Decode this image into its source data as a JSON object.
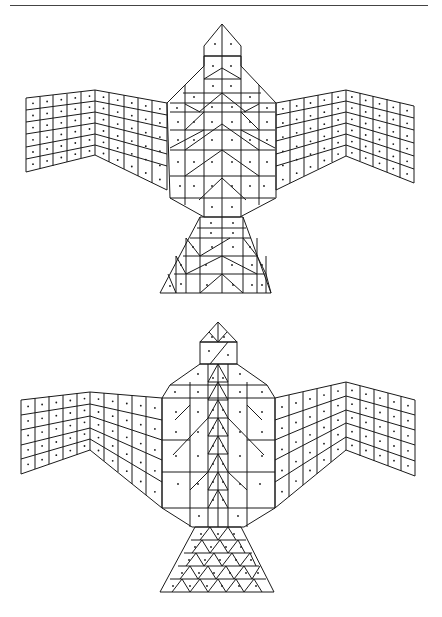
{
  "page": {
    "title": "Two eagle-shaped block pattern diagrams",
    "top_rule": true
  },
  "figures": [
    {
      "id": "eagle-top",
      "label": "Eagle pattern 1",
      "body": {
        "head": "pointed pentagon head split vertically",
        "torso": "chevron-lined hexagon body with diagonal divisions",
        "tail": "trapezoid tail with diagonal triangle cells"
      },
      "wings": {
        "left": {
          "rows": 6,
          "cols": 10
        },
        "right": {
          "rows": 6,
          "cols": 10
        }
      },
      "bbox": [
        20,
        22,
        420,
        295
      ]
    },
    {
      "id": "eagle-bottom",
      "label": "Eagle pattern 2",
      "body": {
        "head": "triangle cap over rectangular head with diagonal",
        "torso": "central column of stacked chevrons flanked by panels",
        "tail": "trapezoid tail tiled with alternating triangles"
      },
      "wings": {
        "left": {
          "rows": 5,
          "cols": 10
        },
        "right": {
          "rows": 5,
          "cols": 10
        }
      },
      "bbox": [
        15,
        320,
        425,
        590
      ]
    }
  ],
  "colors": {
    "line": "#1a1a1a",
    "background": "#ffffff",
    "rule": "#444444"
  }
}
